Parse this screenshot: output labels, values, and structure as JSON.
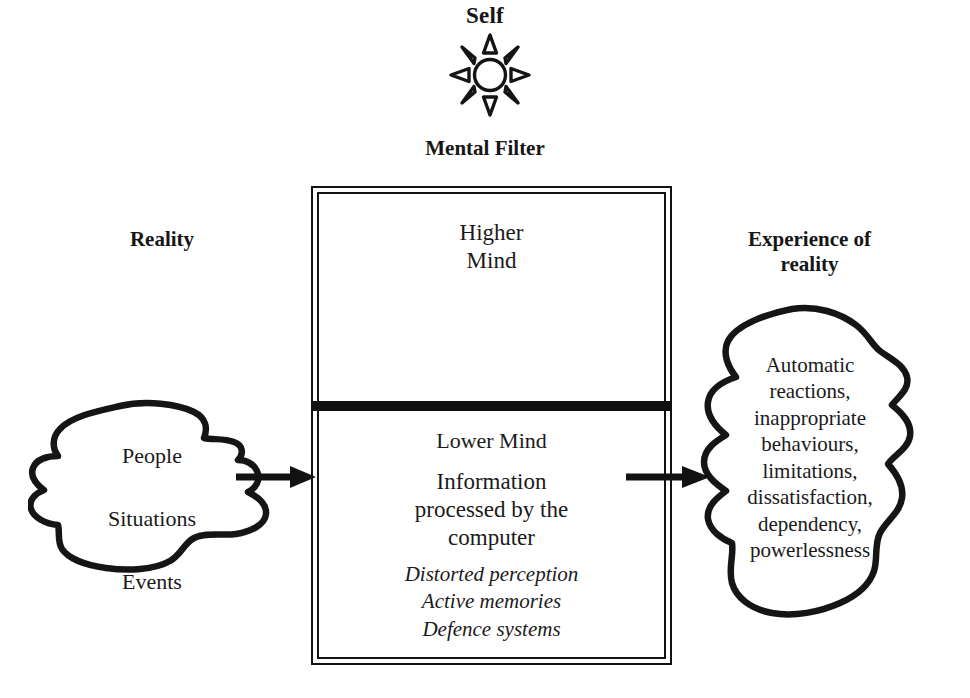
{
  "diagram": {
    "title": "Self",
    "self": {
      "label": "Self",
      "icon": "sun-icon",
      "rays": 8
    },
    "mental_filter": {
      "heading": "Mental Filter",
      "upper_section": {
        "label": "Higher\nMind"
      },
      "divider": "thick-black-bar",
      "lower_section": {
        "label": "Lower Mind",
        "body": "Information\nprocessed by the\ncomputer",
        "italic_items": "Distorted perception\nActive memories\nDefence systems"
      }
    },
    "left": {
      "heading": "Reality",
      "blob_items": [
        "People",
        "Situations",
        "Events"
      ]
    },
    "right": {
      "heading": "Experience of\nreality",
      "blob_text": "Automatic\nreactions,\ninappropriate\nbehaviours,\nlimitations,\ndissatisfaction,\ndependency,\npowerlessness"
    },
    "arrows": [
      {
        "name": "arrow-reality-to-filter",
        "direction": "right"
      },
      {
        "name": "arrow-filter-to-experience",
        "direction": "right"
      }
    ],
    "colors": {
      "ink": "#111111",
      "background": "#ffffff"
    }
  }
}
